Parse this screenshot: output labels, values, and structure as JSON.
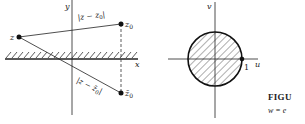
{
  "left_figure": {
    "axes": {
      "x_label": "x",
      "y_label": "y"
    },
    "points": {
      "z": "z",
      "z0_main": "z",
      "z0_sub": "0",
      "zbar0_main": "z̄",
      "zbar0_sub": "0"
    },
    "labels": {
      "dist_upper": "|z − z",
      "dist_upper_sub": "0",
      "dist_upper_close": "|",
      "dist_lower": "|z − z̄",
      "dist_lower_sub": "0",
      "dist_lower_close": "|"
    },
    "region": "upper half-plane (hatched boundary along x-axis)"
  },
  "right_figure": {
    "axes": {
      "x_label": "u",
      "y_label": "v"
    },
    "tick_label": "1",
    "region": "unit disk (hatched)"
  },
  "caption": {
    "title": "FIGU",
    "equation": "w = e"
  },
  "colors": {
    "ink": "#222222",
    "background": "#ffffff"
  }
}
